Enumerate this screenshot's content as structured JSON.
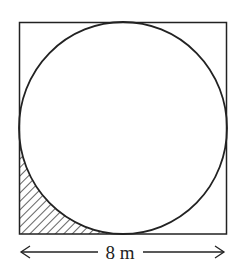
{
  "diagram": {
    "type": "geometry",
    "square": {
      "x": 19,
      "y": 22,
      "size": 208
    },
    "circle": {
      "cx": 123,
      "cy": 128,
      "r": 106
    },
    "shaded_region": "bottom-left corner between square and circle",
    "dimension": {
      "label": "8 m",
      "side": "bottom"
    },
    "colors": {
      "stroke": "#222222",
      "background": "#ffffff"
    }
  }
}
